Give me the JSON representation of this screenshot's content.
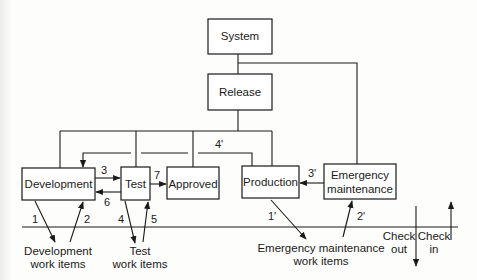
{
  "diagram": {
    "nodes": {
      "system": {
        "label": "System"
      },
      "release": {
        "label": "Release"
      },
      "development": {
        "label": "Development"
      },
      "test": {
        "label": "Test"
      },
      "approved": {
        "label": "Approved"
      },
      "production": {
        "label": "Production"
      },
      "emergency": {
        "line1": "Emergency",
        "line2": "maintenance"
      }
    },
    "edge_labels": {
      "e3": "3",
      "e6": "6",
      "e7": "7",
      "e4p": "4'",
      "e3p": "3'",
      "e1": "1",
      "e2": "2",
      "e4": "4",
      "e5": "5",
      "e1p": "1'",
      "e2p": "2'"
    },
    "work_items": {
      "development": {
        "line1": "Development",
        "line2": "work items"
      },
      "test": {
        "line1": "Test",
        "line2": "work items"
      },
      "emergency": {
        "line1": "Emergency maintenance",
        "line2": "work items"
      }
    },
    "legend": {
      "check_out": {
        "line1": "Check",
        "line2": "out"
      },
      "check_in": {
        "line1": "Check",
        "line2": "in"
      }
    }
  }
}
